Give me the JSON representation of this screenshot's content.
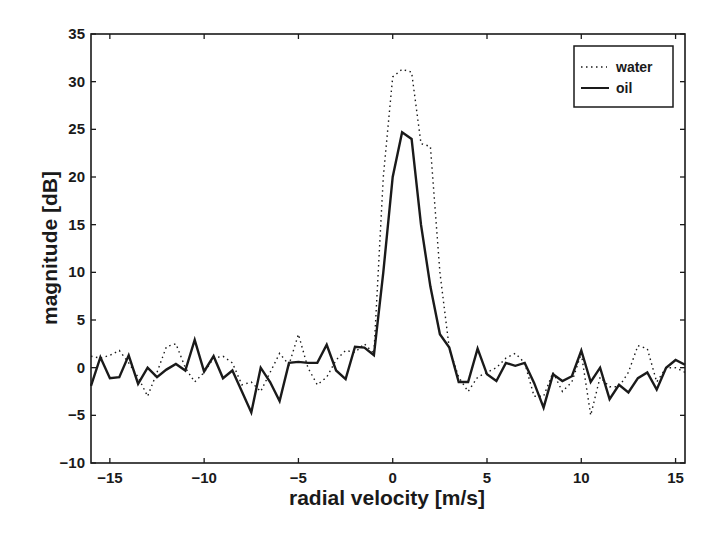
{
  "chart_data": {
    "type": "line",
    "title": "",
    "xlabel": "radial velocity [m/s]",
    "ylabel": "magnitude [dB]",
    "xlim": [
      -16,
      15.5
    ],
    "ylim": [
      -10,
      35
    ],
    "xticks": [
      -15,
      -10,
      -5,
      0,
      5,
      10,
      15
    ],
    "yticks": [
      -10,
      -5,
      0,
      5,
      10,
      15,
      20,
      25,
      30,
      35
    ],
    "grid": false,
    "legend_position": "upper right",
    "series": [
      {
        "name": "water",
        "style": "dotted",
        "x": [
          -16.0,
          -15.5,
          -15.0,
          -14.5,
          -14.0,
          -13.5,
          -13.0,
          -12.5,
          -12.0,
          -11.5,
          -11.0,
          -10.5,
          -10.0,
          -9.5,
          -9.0,
          -8.5,
          -8.0,
          -7.5,
          -7.0,
          -6.5,
          -6.0,
          -5.5,
          -5.0,
          -4.5,
          -4.0,
          -3.5,
          -3.0,
          -2.5,
          -2.0,
          -1.5,
          -1.0,
          -0.5,
          0.0,
          0.5,
          1.0,
          1.5,
          2.0,
          2.5,
          3.0,
          3.5,
          4.0,
          4.5,
          5.0,
          5.5,
          6.0,
          6.5,
          7.0,
          7.5,
          8.0,
          8.5,
          9.0,
          9.5,
          10.0,
          10.5,
          11.0,
          11.5,
          12.0,
          12.5,
          13.0,
          13.5,
          14.0,
          14.5,
          15.0,
          15.5
        ],
        "values": [
          1.2,
          1.0,
          1.3,
          1.8,
          0.5,
          -1.0,
          -3.0,
          -0.5,
          2.2,
          2.5,
          0.0,
          -1.5,
          -0.5,
          1.0,
          1.2,
          0.5,
          -1.8,
          -1.5,
          -2.5,
          -0.5,
          1.5,
          0.3,
          3.5,
          0.0,
          -1.8,
          -1.0,
          0.8,
          1.8,
          1.6,
          2.5,
          1.5,
          20.0,
          30.5,
          31.3,
          31.0,
          23.5,
          23.2,
          10.0,
          2.0,
          -1.0,
          -2.5,
          -1.0,
          -0.5,
          0.0,
          1.0,
          1.5,
          0.5,
          -3.0,
          -3.0,
          -0.5,
          -2.5,
          -1.5,
          1.5,
          -5.0,
          -1.0,
          -2.0,
          -2.0,
          -0.5,
          2.3,
          2.0,
          -1.5,
          0.0,
          0.0,
          -0.5
        ]
      },
      {
        "name": "oil",
        "style": "solid",
        "x": [
          -16.0,
          -15.5,
          -15.0,
          -14.5,
          -14.0,
          -13.5,
          -13.0,
          -12.5,
          -12.0,
          -11.5,
          -11.0,
          -10.5,
          -10.0,
          -9.5,
          -9.0,
          -8.5,
          -8.0,
          -7.5,
          -7.0,
          -6.5,
          -6.0,
          -5.5,
          -5.0,
          -4.5,
          -4.0,
          -3.5,
          -3.0,
          -2.5,
          -2.0,
          -1.5,
          -1.0,
          -0.5,
          0.0,
          0.5,
          1.0,
          1.5,
          2.0,
          2.5,
          3.0,
          3.5,
          4.0,
          4.5,
          5.0,
          5.5,
          6.0,
          6.5,
          7.0,
          7.5,
          8.0,
          8.5,
          9.0,
          9.5,
          10.0,
          10.5,
          11.0,
          11.5,
          12.0,
          12.5,
          13.0,
          13.5,
          14.0,
          14.5,
          15.0,
          15.5
        ],
        "values": [
          -1.9,
          1.1,
          -1.1,
          -1.0,
          1.3,
          -1.7,
          0.0,
          -1.0,
          -0.2,
          0.4,
          -0.3,
          2.9,
          -0.4,
          1.2,
          -1.1,
          -0.3,
          -2.5,
          -4.7,
          0.0,
          -1.5,
          -3.5,
          0.5,
          0.6,
          0.5,
          0.5,
          2.4,
          -0.3,
          -1.2,
          2.2,
          2.1,
          1.3,
          10.0,
          20.0,
          24.7,
          24.0,
          15.0,
          8.5,
          3.5,
          2.1,
          -1.5,
          -1.5,
          2.0,
          -0.7,
          -1.4,
          0.5,
          0.2,
          0.5,
          -1.6,
          -4.2,
          -0.7,
          -1.4,
          -0.9,
          1.8,
          -1.5,
          0.0,
          -3.3,
          -1.8,
          -2.6,
          -1.1,
          -0.5,
          -2.3,
          0.0,
          0.8,
          0.3
        ]
      }
    ]
  },
  "legend": {
    "items": [
      {
        "label": "water",
        "style": "dotted"
      },
      {
        "label": "oil",
        "style": "solid"
      }
    ]
  },
  "axes": {
    "xlabel": "radial velocity [m/s]",
    "ylabel": "magnitude [dB]",
    "xtick_labels": [
      "−15",
      "−10",
      "−5",
      "0",
      "5",
      "10",
      "15"
    ],
    "ytick_labels": [
      "−10",
      "−5",
      "0",
      "5",
      "10",
      "15",
      "20",
      "25",
      "30",
      "35"
    ]
  },
  "colors": {
    "line": "#1a1a1a",
    "background": "#ffffff"
  }
}
